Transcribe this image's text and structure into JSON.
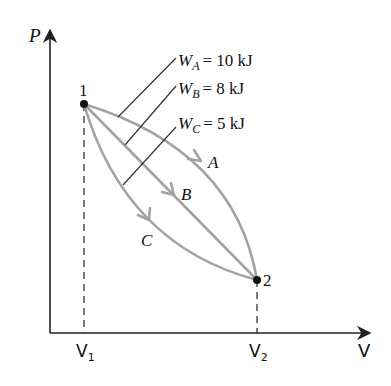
{
  "diagram": {
    "y_axis_label": "P",
    "x_axis_label": "V",
    "x_ticks": [
      {
        "main": "V",
        "sub": "1"
      },
      {
        "main": "V",
        "sub": "2"
      }
    ],
    "states": [
      {
        "label": "1"
      },
      {
        "label": "2"
      }
    ],
    "paths": [
      {
        "name": "A",
        "work_symbol": "W",
        "work_sub": "A",
        "work_value": "= 10 kJ"
      },
      {
        "name": "B",
        "work_symbol": "W",
        "work_sub": "B",
        "work_value": "= 8 kJ"
      },
      {
        "name": "C",
        "work_symbol": "W",
        "work_sub": "C",
        "work_value": "= 5 kJ"
      }
    ],
    "colors": {
      "axis": "#222222",
      "path": "#a3a3a3",
      "leader": "#333333",
      "point": "#111111"
    }
  }
}
